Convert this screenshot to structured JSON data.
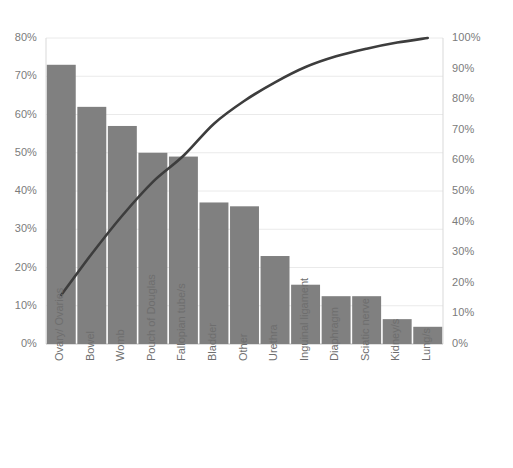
{
  "chart_data": {
    "type": "bar",
    "title": "",
    "subtitle": "",
    "xlabel": "",
    "ylabel": "",
    "categories": [
      "Ovary/ Ovaries",
      "Bowel",
      "Womb",
      "Pouch of Douglas",
      "Fallopian tube/s",
      "Bladder",
      "Other",
      "Urethra",
      "Inguinal ligament",
      "Diaphragm",
      "Sciatic nerve",
      "Kidney/s",
      "Lung/s"
    ],
    "series": [
      {
        "name": "Percentage",
        "type": "bar",
        "axis": "left",
        "values": [
          73,
          62,
          57,
          50,
          49,
          37,
          36,
          23,
          15.5,
          12.5,
          12.5,
          6.5,
          4.5
        ]
      },
      {
        "name": "Cumulative percentage",
        "type": "line",
        "axis": "right",
        "values": [
          16,
          29.5,
          42,
          53,
          61.5,
          72,
          79.5,
          85.5,
          90.5,
          94,
          96.5,
          98.5,
          100
        ]
      }
    ],
    "ylim": [
      0,
      80
    ],
    "y2lim": [
      0,
      100
    ],
    "ytick_labels": [
      "80%",
      "70%",
      "60%",
      "50%",
      "40%",
      "30%",
      "20%",
      "10%",
      "0%"
    ],
    "ytick_values": [
      80,
      70,
      60,
      50,
      40,
      30,
      20,
      10,
      0
    ],
    "y2tick_labels": [
      "100%",
      "90%",
      "80%",
      "70%",
      "60%",
      "50%",
      "40%",
      "30%",
      "20%",
      "10%",
      "0%"
    ],
    "y2tick_values": [
      100,
      90,
      80,
      70,
      60,
      50,
      40,
      30,
      20,
      10,
      0
    ],
    "grid": true,
    "legend": "none",
    "colors": {
      "bar": "#808080",
      "line": "#3d3d3d",
      "gridline": "#eaeaea",
      "axis_text": "#7b7b7b",
      "plot_background": "#ffffff"
    }
  }
}
